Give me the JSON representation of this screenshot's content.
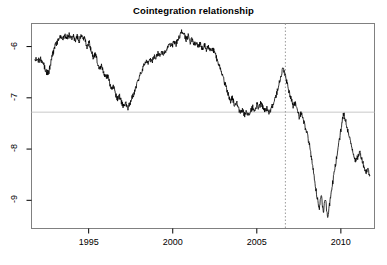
{
  "chart_data": {
    "type": "line",
    "title": "Cointegration relationship",
    "xlabel": "",
    "ylabel": "",
    "xlim": [
      1991.6,
      2012.0
    ],
    "ylim": [
      -9.55,
      -5.55
    ],
    "grid": false,
    "legend": null,
    "x_ticks": [
      1995,
      2000,
      2005,
      2010
    ],
    "x_tick_labels": [
      "1995",
      "2000",
      "2005",
      "2010"
    ],
    "y_ticks": [
      -6,
      -7,
      -8,
      -9
    ],
    "y_tick_labels": [
      "-6",
      "-7",
      "-8",
      "-9"
    ],
    "line_color": "#000000",
    "line_width": 0.8,
    "annotations": [
      {
        "name": "break-date-vline",
        "type": "vline",
        "x": 2006.7,
        "style": "dotted",
        "color": "#9a9a9a"
      },
      {
        "name": "equilibrium-mean-hline",
        "type": "hline",
        "y": -7.28,
        "style": "solid",
        "color": "#c8c8c8"
      }
    ],
    "series": [
      {
        "name": "Cointegration residual",
        "x": [
          1991.8,
          1991.92,
          1992.04,
          1992.16,
          1992.28,
          1992.4,
          1992.52,
          1992.64,
          1992.76,
          1992.88,
          1993.0,
          1993.12,
          1993.24,
          1993.36,
          1993.48,
          1993.6,
          1993.72,
          1993.84,
          1993.96,
          1994.08,
          1994.2,
          1994.32,
          1994.44,
          1994.56,
          1994.68,
          1994.8,
          1994.92,
          1995.04,
          1995.16,
          1995.28,
          1995.4,
          1995.52,
          1995.64,
          1995.76,
          1995.88,
          1996.0,
          1996.12,
          1996.24,
          1996.36,
          1996.48,
          1996.6,
          1996.72,
          1996.84,
          1996.96,
          1997.08,
          1997.2,
          1997.32,
          1997.44,
          1997.56,
          1997.68,
          1997.8,
          1997.92,
          1998.04,
          1998.16,
          1998.28,
          1998.4,
          1998.52,
          1998.64,
          1998.76,
          1998.88,
          1999.0,
          1999.12,
          1999.24,
          1999.36,
          1999.48,
          1999.6,
          1999.72,
          1999.84,
          1999.96,
          2000.08,
          2000.2,
          2000.32,
          2000.44,
          2000.56,
          2000.68,
          2000.8,
          2000.92,
          2001.04,
          2001.16,
          2001.28,
          2001.4,
          2001.52,
          2001.64,
          2001.76,
          2001.88,
          2002.0,
          2002.12,
          2002.24,
          2002.36,
          2002.48,
          2002.6,
          2002.72,
          2002.84,
          2002.96,
          2003.08,
          2003.2,
          2003.32,
          2003.44,
          2003.56,
          2003.68,
          2003.8,
          2003.92,
          2004.04,
          2004.16,
          2004.28,
          2004.4,
          2004.52,
          2004.64,
          2004.76,
          2004.88,
          2005.0,
          2005.12,
          2005.24,
          2005.36,
          2005.48,
          2005.6,
          2005.72,
          2005.84,
          2005.96,
          2006.08,
          2006.2,
          2006.32,
          2006.44,
          2006.56,
          2006.68,
          2006.8,
          2006.92,
          2007.04,
          2007.16,
          2007.28,
          2007.4,
          2007.52,
          2007.64,
          2007.76,
          2007.88,
          2008.0,
          2008.12,
          2008.24,
          2008.36,
          2008.48,
          2008.6,
          2008.72,
          2008.84,
          2008.96,
          2009.08,
          2009.2,
          2009.32,
          2009.44,
          2009.56,
          2009.68,
          2009.8,
          2009.92,
          2010.04,
          2010.16,
          2010.28,
          2010.4,
          2010.52,
          2010.64,
          2010.76,
          2010.88,
          2011.0,
          2011.12,
          2011.24,
          2011.36,
          2011.48,
          2011.6,
          2011.72
        ],
        "y": [
          -6.3,
          -6.22,
          -6.28,
          -6.24,
          -6.31,
          -6.42,
          -6.52,
          -6.48,
          -6.3,
          -6.12,
          -6.0,
          -5.92,
          -5.86,
          -5.8,
          -5.84,
          -5.78,
          -5.82,
          -5.76,
          -5.84,
          -5.78,
          -5.88,
          -5.8,
          -5.9,
          -5.76,
          -5.82,
          -5.88,
          -6.02,
          -5.92,
          -6.1,
          -6.22,
          -6.14,
          -6.3,
          -6.42,
          -6.36,
          -6.5,
          -6.62,
          -6.56,
          -6.7,
          -6.84,
          -6.78,
          -6.92,
          -7.04,
          -6.96,
          -7.1,
          -7.18,
          -7.1,
          -7.2,
          -7.12,
          -7.02,
          -6.92,
          -6.8,
          -6.68,
          -6.58,
          -6.46,
          -6.36,
          -6.28,
          -6.34,
          -6.22,
          -6.3,
          -6.18,
          -6.24,
          -6.12,
          -6.18,
          -6.1,
          -6.16,
          -6.08,
          -6.02,
          -5.94,
          -6.0,
          -5.9,
          -5.96,
          -5.84,
          -5.78,
          -5.7,
          -5.76,
          -5.86,
          -5.8,
          -5.92,
          -5.86,
          -5.96,
          -5.9,
          -6.0,
          -5.94,
          -6.04,
          -5.96,
          -6.06,
          -5.98,
          -6.08,
          -6.02,
          -6.12,
          -6.22,
          -6.34,
          -6.46,
          -6.58,
          -6.7,
          -6.82,
          -6.94,
          -7.06,
          -7.0,
          -7.16,
          -7.08,
          -7.22,
          -7.3,
          -7.24,
          -7.34,
          -7.28,
          -7.36,
          -7.26,
          -7.18,
          -7.24,
          -7.12,
          -7.2,
          -7.1,
          -7.18,
          -7.26,
          -7.2,
          -7.3,
          -7.22,
          -7.14,
          -7.04,
          -6.9,
          -6.72,
          -6.56,
          -6.44,
          -6.54,
          -6.72,
          -6.88,
          -7.02,
          -7.16,
          -7.1,
          -7.24,
          -7.38,
          -7.3,
          -7.44,
          -7.58,
          -7.72,
          -7.9,
          -8.14,
          -8.42,
          -8.7,
          -8.96,
          -9.14,
          -8.9,
          -9.22,
          -8.96,
          -9.34,
          -9.1,
          -8.8,
          -8.56,
          -8.3,
          -8.06,
          -7.8,
          -7.56,
          -7.3,
          -7.44,
          -7.62,
          -7.8,
          -7.94,
          -8.1,
          -8.24,
          -8.16,
          -8.06,
          -8.18,
          -8.32,
          -8.46,
          -8.38,
          -8.52
        ]
      }
    ]
  }
}
